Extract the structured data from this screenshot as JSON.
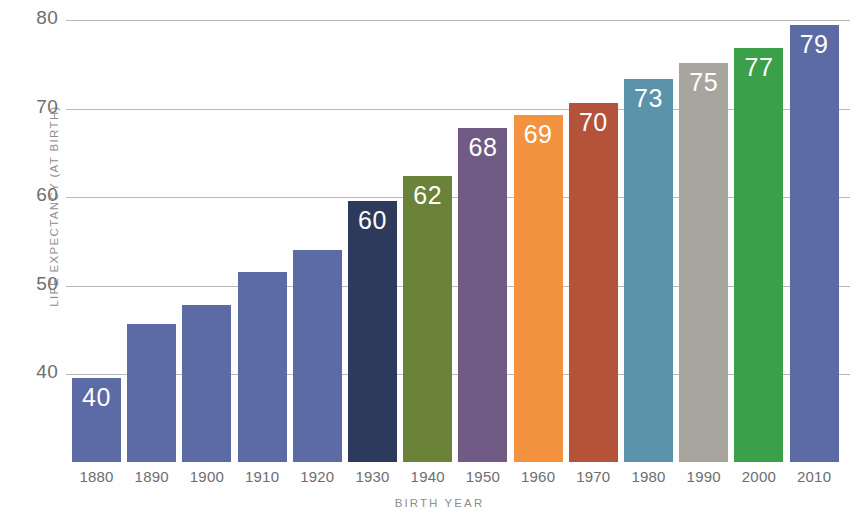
{
  "chart_data": {
    "type": "bar",
    "title": "",
    "xlabel": "BIRTH YEAR",
    "ylabel": "LIFE EXPECTANCY (AT BIRTH)",
    "categories": [
      "1880",
      "1890",
      "1900",
      "1910",
      "1920",
      "1930",
      "1940",
      "1950",
      "1960",
      "1970",
      "1980",
      "1990",
      "2000",
      "2010"
    ],
    "values": [
      39.6,
      45.7,
      47.8,
      51.5,
      54.0,
      59.5,
      62.4,
      67.8,
      69.3,
      70.6,
      73.3,
      75.1,
      76.8,
      79.4
    ],
    "data_labels": [
      "40",
      "",
      "",
      "",
      "",
      "60",
      "62",
      "68",
      "69",
      "70",
      "73",
      "75",
      "77",
      "79"
    ],
    "bar_colors": [
      "#5c6ba5",
      "#5c6ba5",
      "#5c6ba5",
      "#5c6ba5",
      "#5c6ba5",
      "#2e3a5c",
      "#6b8239",
      "#6f5b84",
      "#f3923f",
      "#b5523a",
      "#5b93ab",
      "#a8a59e",
      "#3ba049",
      "#5c6ba5"
    ],
    "ylim": [
      35,
      81.5
    ],
    "yticks": [
      40,
      50,
      60,
      70,
      80
    ],
    "ytick_labels": [
      "40",
      "50",
      "60",
      "70",
      "80"
    ],
    "grid": true,
    "grid_color": "#b9b9b9",
    "legend": "none",
    "background": "#fefefe",
    "axis_text_color": "#6d6e70",
    "label_text_color": "#8e8e90"
  }
}
